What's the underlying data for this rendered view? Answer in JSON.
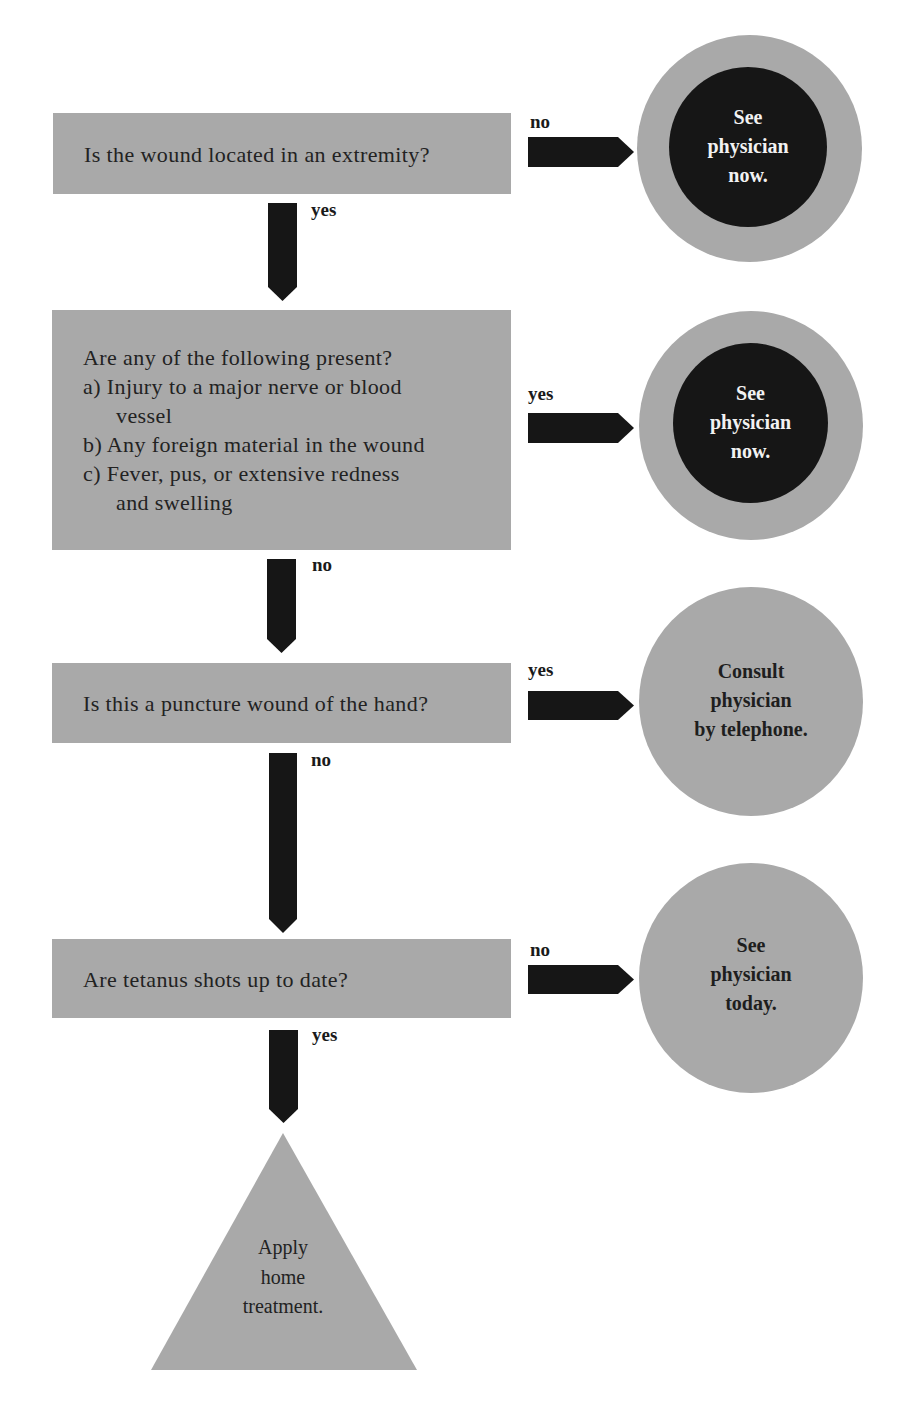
{
  "flowchart": {
    "steps": [
      {
        "question": "Is the wound located in an extremity?",
        "down_label": "yes",
        "side_label": "no",
        "outcome": [
          "See",
          "physician",
          "now."
        ],
        "outcome_style": "urgent"
      },
      {
        "question_title": "Are any of the following present?",
        "question_items": [
          {
            "marker": "a)",
            "lines": [
              "Injury to a major nerve or blood",
              "vessel"
            ]
          },
          {
            "marker": "b)",
            "lines": [
              "Any foreign material in the wound"
            ]
          },
          {
            "marker": "c)",
            "lines": [
              "Fever, pus, or extensive redness",
              "and swelling"
            ]
          }
        ],
        "down_label": "no",
        "side_label": "yes",
        "outcome": [
          "See",
          "physician",
          "now."
        ],
        "outcome_style": "urgent"
      },
      {
        "question": "Is this a puncture wound of the hand?",
        "down_label": "no",
        "side_label": "yes",
        "outcome": [
          "Consult",
          "physician",
          "by telephone."
        ],
        "outcome_style": "normal"
      },
      {
        "question": "Are tetanus shots up to date?",
        "down_label": "yes",
        "side_label": "no",
        "outcome": [
          "See",
          "physician",
          "today."
        ],
        "outcome_style": "normal"
      }
    ],
    "final": [
      "Apply",
      "home",
      "treatment."
    ]
  },
  "colors": {
    "box_gray": "#a9a9a9",
    "arrow_dark": "#161616",
    "urgent_fill": "#161616",
    "background": "#ffffff"
  }
}
